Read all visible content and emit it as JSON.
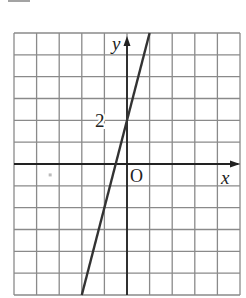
{
  "figure": {
    "type": "coordinate-grid-with-line",
    "grid": {
      "columns": 10,
      "rows": 12,
      "origin_col": 5,
      "origin_row": 6,
      "color": "#8a8a8a"
    },
    "axes": {
      "x_label": "x",
      "y_label": "y",
      "origin_label": "O",
      "color": "#222222"
    },
    "tick_labels": [
      {
        "axis": "y",
        "value": 2,
        "text": "2"
      }
    ],
    "line": {
      "equation": "y = 4x + 2",
      "slope": 4,
      "intercept": 2,
      "x_range": [
        -3,
        0
      ],
      "color": "#333333"
    },
    "artifact_dot": {
      "x": -3.4,
      "y": -0.5,
      "color": "#bbbbbb"
    }
  }
}
